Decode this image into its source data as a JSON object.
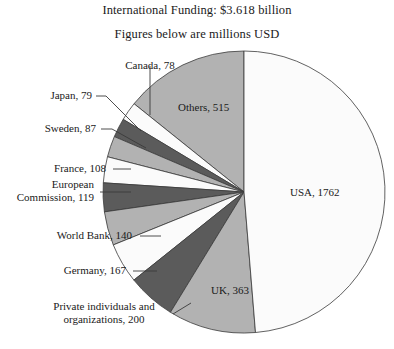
{
  "title": {
    "main": "International Funding: $3.618 billion",
    "sub": "Figures below are millions USD"
  },
  "colors": {
    "background": "#ffffff",
    "text": "#1a1a1a",
    "outline": "#3a3a3a",
    "slice_white": "#fbfbfb",
    "slice_light": "#f0f0f0",
    "slice_medium": "#b2b2b2",
    "slice_dark": "#5b5b5b"
  },
  "chart_data": {
    "type": "pie",
    "title": "International Funding: $3.618 billion",
    "subtitle": "Figures below are millions USD",
    "units": "millions USD",
    "total": 3618,
    "start_angle_deg": 90,
    "direction": "counterclockwise",
    "legend": "none",
    "grid": false,
    "categories": [
      "Others",
      "Canada",
      "Japan",
      "Sweden",
      "France",
      "European Commission",
      "World Bank",
      "Germany",
      "Private individuals and organizations",
      "UK",
      "USA"
    ],
    "values": [
      515,
      78,
      79,
      87,
      108,
      119,
      140,
      167,
      200,
      363,
      1762
    ],
    "slices": [
      {
        "label": "Others, 515",
        "name": "Others",
        "value": 515,
        "fill": "#b2b2b2",
        "placement": "inside"
      },
      {
        "label": "Canada, 78",
        "name": "Canada",
        "value": 78,
        "fill": "#fbfbfb",
        "placement": "callout"
      },
      {
        "label": "Japan, 79",
        "name": "Japan",
        "value": 79,
        "fill": "#5b5b5b",
        "placement": "callout"
      },
      {
        "label": "Sweden, 87",
        "name": "Sweden",
        "value": 87,
        "fill": "#b2b2b2",
        "placement": "callout"
      },
      {
        "label": "France, 108",
        "name": "France",
        "value": 108,
        "fill": "#fbfbfb",
        "placement": "callout"
      },
      {
        "label": "European Commission, 119",
        "name": "European Commission",
        "value": 119,
        "fill": "#5b5b5b",
        "placement": "callout"
      },
      {
        "label": "World Bank, 140",
        "name": "World Bank",
        "value": 140,
        "fill": "#b2b2b2",
        "placement": "callout"
      },
      {
        "label": "Germany, 167",
        "name": "Germany",
        "value": 167,
        "fill": "#fbfbfb",
        "placement": "callout"
      },
      {
        "label": "Private individuals and organizations, 200",
        "name": "Private individuals and organizations",
        "value": 200,
        "fill": "#5b5b5b",
        "placement": "callout"
      },
      {
        "label": "UK, 363",
        "name": "UK",
        "value": 363,
        "fill": "#b2b2b2",
        "placement": "inside"
      },
      {
        "label": "USA, 1762",
        "name": "USA",
        "value": 1762,
        "fill": "#fbfbfb",
        "placement": "inside"
      }
    ]
  },
  "labels": {
    "others": "Others, 515",
    "usa": "USA, 1762",
    "uk": "UK, 363",
    "canada": "Canada, 78",
    "japan": "Japan, 79",
    "sweden": "Sweden, 87",
    "france": "France, 108",
    "ec_line1": "European",
    "ec_line2": "Commission, 119",
    "worldbank": "World Bank, 140",
    "germany": "Germany, 167",
    "private_line1": "Private individuals and",
    "private_line2": "organizations, 200"
  }
}
